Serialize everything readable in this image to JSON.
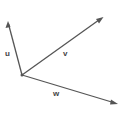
{
  "diagram": {
    "origin": [
      22,
      75
    ],
    "color": "#555555",
    "vectors": [
      {
        "name": "u",
        "label": "u",
        "tip": [
          8,
          22
        ],
        "label_pos": [
          8,
          54
        ]
      },
      {
        "name": "v",
        "label": "v",
        "tip": [
          103,
          17
        ],
        "label_pos": [
          64,
          55
        ]
      },
      {
        "name": "w",
        "label": "w",
        "tip": [
          118,
          104
        ],
        "label_pos": [
          54,
          95
        ]
      }
    ]
  }
}
